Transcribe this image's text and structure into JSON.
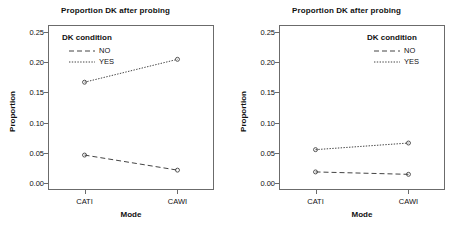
{
  "figure": {
    "background": "#ffffff",
    "line_color": "#444444",
    "axis_color": "#6b6b6b"
  },
  "legend": {
    "title": "DK condition",
    "entries": [
      {
        "label": "NO",
        "dash": "dashed"
      },
      {
        "label": "YES",
        "dash": "dotted"
      }
    ]
  },
  "chart_data": [
    {
      "type": "line",
      "panel": "left",
      "title": "Proportion DK after probing",
      "xlabel": "Mode",
      "ylabel": "Proportion",
      "categories": [
        "CATI",
        "CAWI"
      ],
      "ylim": [
        -0.012,
        0.262
      ],
      "yticks": [
        0.0,
        0.05,
        0.1,
        0.15,
        0.2,
        0.25
      ],
      "ytick_labels": [
        "0.00",
        "0.05",
        "0.10",
        "0.15",
        "0.20",
        "0.25"
      ],
      "grid": false,
      "legend_position": "top-left inside",
      "series": [
        {
          "name": "NO",
          "values": [
            0.046,
            0.021
          ],
          "dash": "dashed",
          "marker": "circle"
        },
        {
          "name": "YES",
          "values": [
            0.167,
            0.205
          ],
          "dash": "dotted",
          "marker": "circle"
        }
      ]
    },
    {
      "type": "line",
      "panel": "right",
      "title": "Proportion DK after probing",
      "xlabel": "Mode",
      "ylabel": "Proportion",
      "categories": [
        "CATI",
        "CAWI"
      ],
      "ylim": [
        -0.012,
        0.262
      ],
      "yticks": [
        0.0,
        0.05,
        0.1,
        0.15,
        0.2,
        0.25
      ],
      "ytick_labels": [
        "0.00",
        "0.05",
        "0.10",
        "0.15",
        "0.20",
        "0.25"
      ],
      "grid": false,
      "legend_position": "top-right inside",
      "series": [
        {
          "name": "NO",
          "values": [
            0.018,
            0.014
          ],
          "dash": "dashed",
          "marker": "circle"
        },
        {
          "name": "YES",
          "values": [
            0.055,
            0.066
          ],
          "dash": "dotted",
          "marker": "circle"
        }
      ]
    }
  ]
}
